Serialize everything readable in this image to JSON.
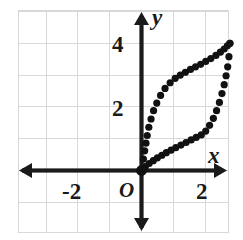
{
  "figure": {
    "kind": "coordinate-plane-scatter",
    "background": "#ffffff",
    "grid_color": "#d8d8d8",
    "axis_color": "#1a1a1a",
    "dot_color": "#111111"
  },
  "axes": {
    "x_axis_label": "x",
    "y_axis_label": "y",
    "origin_label": "O",
    "x_ticks": [
      {
        "value": -2,
        "label": "-2"
      },
      {
        "value": 2,
        "label": "2"
      }
    ],
    "y_ticks": [
      {
        "value": 2,
        "label": "2"
      },
      {
        "value": 4,
        "label": "4"
      }
    ]
  },
  "chart_data": {
    "type": "scatter",
    "title": "",
    "xlabel": "x",
    "ylabel": "y",
    "xlim": [
      -3.9,
      2.8
    ],
    "ylim": [
      -1.9,
      4.9
    ],
    "grid": true,
    "grid_step": 1,
    "legend": "none",
    "series": [
      {
        "name": "upper-branch",
        "x": [
          0.0,
          0.06,
          0.1,
          0.14,
          0.18,
          0.23,
          0.3,
          0.38,
          0.48,
          0.6,
          0.74,
          0.9,
          1.06,
          1.22,
          1.38,
          1.54,
          1.7,
          1.86,
          2.02,
          2.18,
          2.34,
          2.48,
          2.6,
          2.7,
          2.78
        ],
        "y": [
          0.0,
          0.36,
          0.62,
          0.86,
          1.1,
          1.36,
          1.62,
          1.88,
          2.12,
          2.36,
          2.58,
          2.76,
          2.9,
          3.0,
          3.09,
          3.18,
          3.26,
          3.34,
          3.43,
          3.52,
          3.62,
          3.72,
          3.82,
          3.92,
          4.0
        ]
      },
      {
        "name": "lower-branch",
        "x": [
          0.0,
          0.12,
          0.24,
          0.37,
          0.5,
          0.64,
          0.78,
          0.93,
          1.08,
          1.24,
          1.4,
          1.56,
          1.72,
          1.88,
          2.02,
          2.14,
          2.26,
          2.36,
          2.45,
          2.53,
          2.6,
          2.66,
          2.71,
          2.75,
          2.78
        ],
        "y": [
          0.0,
          0.12,
          0.22,
          0.31,
          0.4,
          0.48,
          0.56,
          0.64,
          0.72,
          0.8,
          0.88,
          0.96,
          1.04,
          1.12,
          1.24,
          1.42,
          1.64,
          1.88,
          2.14,
          2.42,
          2.7,
          2.98,
          3.26,
          3.58,
          4.0
        ]
      }
    ]
  }
}
